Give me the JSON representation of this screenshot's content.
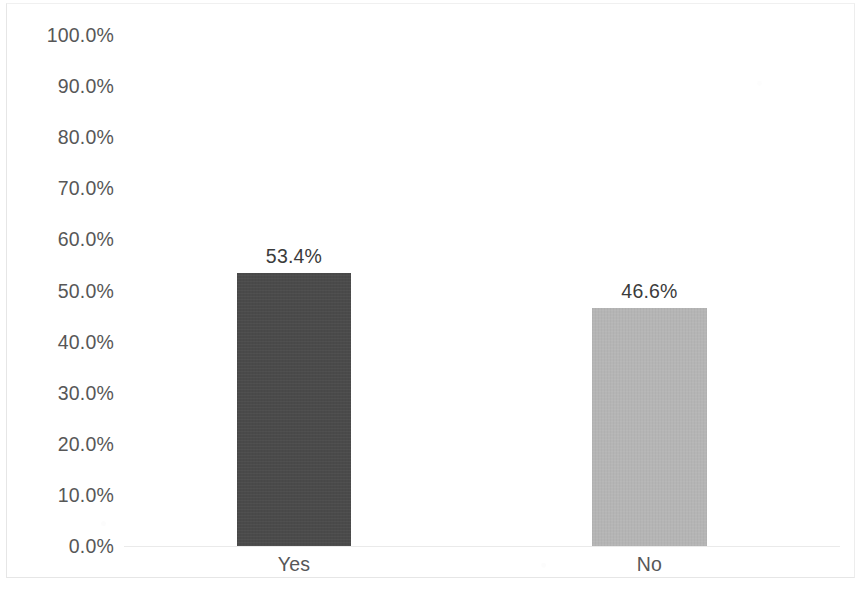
{
  "chart_data": {
    "type": "bar",
    "title": "",
    "subtitle": "",
    "xlabel": "",
    "ylabel": "",
    "categories": [
      "Yes",
      "No"
    ],
    "values": [
      53.4,
      46.6
    ],
    "value_labels": [
      "53.4%",
      "46.6%"
    ],
    "ylim": [
      0,
      100
    ],
    "ytick_labels": [
      "100.0%",
      "90.0%",
      "80.0%",
      "70.0%",
      "60.0%",
      "50.0%",
      "40.0%",
      "30.0%",
      "20.0%",
      "10.0%",
      "0.0%"
    ],
    "ytick_values": [
      100,
      90,
      80,
      70,
      60,
      50,
      40,
      30,
      20,
      10,
      0
    ],
    "grid": false,
    "legend": "none",
    "bar_colors": [
      "#4a4a4a",
      "#b5b5b5"
    ],
    "colors": {
      "bar_dark": "#4a4a4a",
      "bar_light": "#b5b5b5",
      "tick_text": "#575757",
      "value_text": "#3b3b3b",
      "frame": "#e6e6e6",
      "background": "#ffffff"
    }
  }
}
